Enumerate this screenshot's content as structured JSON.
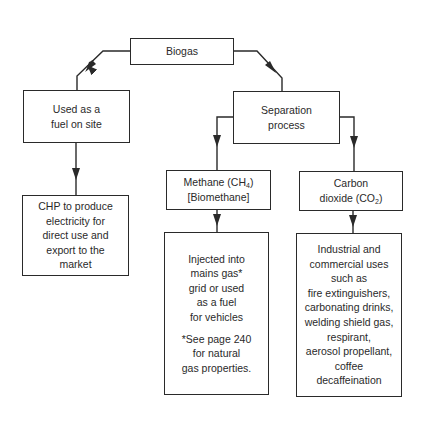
{
  "diagram": {
    "root": {
      "label": "Biogas"
    },
    "left_branch": {
      "label_lines": [
        "Used as a",
        "fuel on site"
      ],
      "child": {
        "label_lines": [
          "CHP to produce",
          "electricity for",
          "direct use and",
          "export to the",
          "market"
        ]
      }
    },
    "right_branch": {
      "label_lines": [
        "Separation",
        "process"
      ],
      "methane": {
        "line1_prefix": "Methane (CH",
        "line1_sub": "4",
        "line1_suffix": ")",
        "line2": "[Biomethane]",
        "child": {
          "label_lines": [
            "Injected into",
            "mains gas*",
            "grid or used",
            "as a fuel",
            "for vehicles"
          ],
          "footnote_lines": [
            "*See page 240",
            "for natural",
            "gas properties."
          ]
        }
      },
      "co2": {
        "line1": "Carbon",
        "line2_prefix": "dioxide (CO",
        "line2_sub": "2",
        "line2_suffix": ")",
        "child": {
          "label_lines": [
            "Industrial and",
            "commercial uses",
            "such as",
            "fire extinguishers,",
            "carbonating drinks,",
            "welding shield gas,",
            "respirant,",
            "aerosol propellant,",
            "coffee",
            "decaffeination"
          ]
        }
      }
    }
  }
}
